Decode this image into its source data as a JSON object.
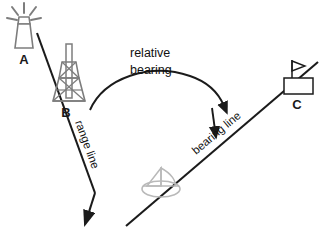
{
  "figure": {
    "type": "navigation-bearing-diagram",
    "background_color": "#ffffff",
    "width": 326,
    "height": 234
  },
  "labels": {
    "point_a": "A",
    "point_b": "B",
    "point_c": "C",
    "relative_line1": "relative",
    "relative_line2": "bearing",
    "range_line": "range line",
    "bearing_line": "bearing line"
  },
  "symbols": {
    "a": {
      "name": "lighthouse-symbol",
      "label": "A",
      "description": "lighthouse beacon with radiating light rays"
    },
    "b": {
      "name": "radio-tower-symbol",
      "label": "B",
      "description": "lattice radio transmission tower"
    },
    "c": {
      "name": "flagged-building-symbol",
      "label": "C",
      "description": "rectangular building with flag on pole"
    },
    "ship": {
      "name": "sailboat-symbol",
      "label": "",
      "description": "sailboat viewed from above at observer position"
    }
  },
  "lines": {
    "range": {
      "name": "range-line",
      "label": "range line",
      "from": "A through B",
      "to": "bottom-left",
      "arrowhead": "end",
      "color": "#1b1b1b"
    },
    "bearing": {
      "name": "bearing-line",
      "label": "bearing line",
      "from": "observer ship",
      "to": "C",
      "arrowhead": "toward-ship",
      "color": "#1b1b1b"
    },
    "arc": {
      "name": "relative-bearing-arc",
      "label": "relative bearing",
      "arrowhead": "end",
      "color": "#1b1b1b"
    }
  },
  "colors": {
    "line_dark": "#1b1b1b",
    "tower_gray": "#7d7d7d",
    "ship_gray": "#b9b9b9",
    "background": "#ffffff",
    "text": "#111111"
  }
}
